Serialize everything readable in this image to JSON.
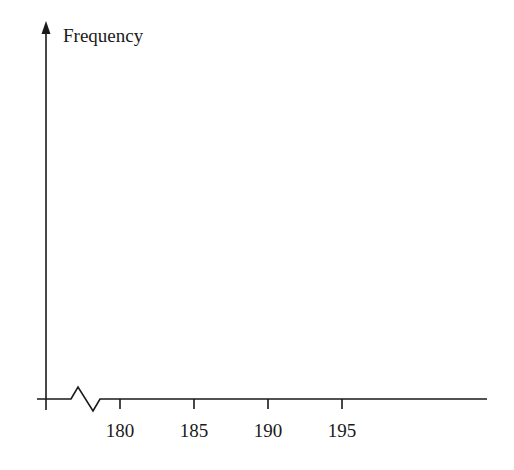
{
  "chart_data": {
    "type": "bar",
    "title": "",
    "xlabel": "",
    "ylabel": "Frequency",
    "x_ticks": [
      180,
      185,
      190,
      195
    ],
    "tick_labels": [
      "180",
      "185",
      "190",
      "195"
    ],
    "categories": [],
    "values": [],
    "axis_break": true,
    "grid": false,
    "legend": null,
    "note": "Empty axes for a frequency histogram; x-axis has a break (zigzag) near origin, ticks at 180–195."
  },
  "axes": {
    "ylabel": "Frequency",
    "ticks": [
      {
        "label": "180",
        "x": 120
      },
      {
        "label": "185",
        "x": 194
      },
      {
        "label": "190",
        "x": 268
      },
      {
        "label": "195",
        "x": 342
      }
    ]
  },
  "colors": {
    "axis": "#1a1a1a",
    "background": "#ffffff"
  }
}
